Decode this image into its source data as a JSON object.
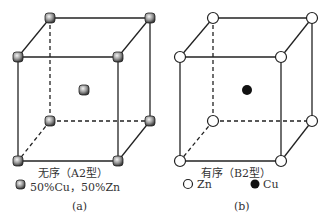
{
  "figures": [
    {
      "id": "a",
      "title": "无序（A2型）",
      "legend": [
        {
          "symbol": "gray-sphere",
          "label": "50%Cu，50%Zn"
        }
      ],
      "caption": "(a)",
      "atom_color": "#777777"
    },
    {
      "id": "b",
      "title": "有序（B2型）",
      "legend": [
        {
          "symbol": "open-circle",
          "label": "Zn"
        },
        {
          "symbol": "filled-circle",
          "label": "Cu"
        }
      ],
      "caption": "(b)",
      "corner_atom_color": "#ffffff",
      "center_atom_color": "#111111"
    }
  ]
}
